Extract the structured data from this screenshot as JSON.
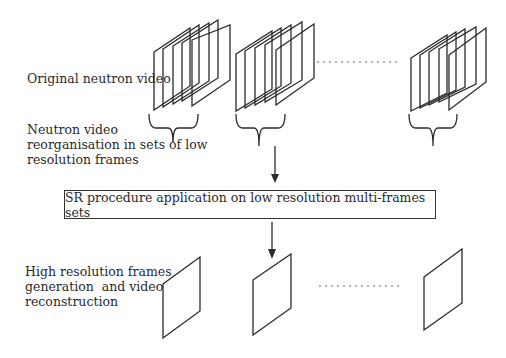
{
  "diagram": {
    "labels": {
      "original_video": "Original neutron video",
      "reorganisation": "Neutron video\nreorganisation in sets of low\nresolution frames",
      "sr_procedure": "SR procedure application on low resolution multi-frames sets",
      "high_res": "High resolution frames\ngeneration  and video\nreconstruction"
    },
    "stacks": [
      {
        "id": "stack-1",
        "frames": 5
      },
      {
        "id": "stack-2",
        "frames": 5
      },
      {
        "id": "stack-n",
        "frames": 5
      }
    ],
    "output_frames": 3,
    "ellipsis": "……………"
  }
}
